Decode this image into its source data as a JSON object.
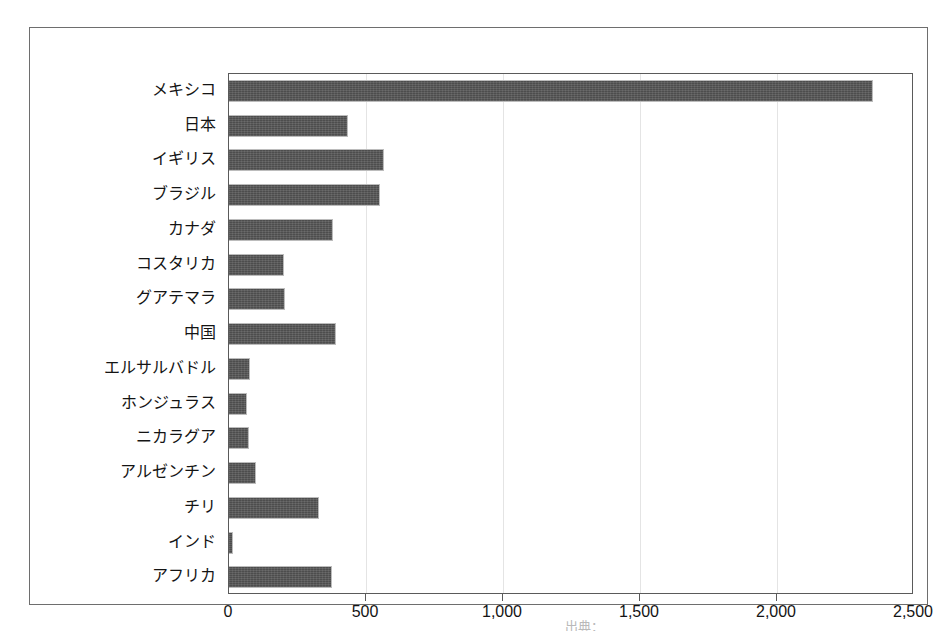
{
  "chart_data": {
    "type": "bar",
    "orientation": "horizontal",
    "title": "",
    "subtitle": "",
    "xlabel": "",
    "ylabel": "",
    "xlim": [
      0,
      2500
    ],
    "xticks": [
      0,
      500,
      1000,
      1500,
      2000,
      2500
    ],
    "xtick_labels": [
      "0",
      "500",
      "1,000",
      "1,500",
      "2,000",
      "2,500"
    ],
    "grid": true,
    "grid_axis": "x",
    "legend": false,
    "legend_position": "none",
    "bar_color": "#4d4d4d",
    "categories": [
      "メキシコ",
      "日本",
      "イギリス",
      "ブラジル",
      "カナダ",
      "コスタリカ",
      "グアテマラ",
      "中国",
      "エルサルバドル",
      "ホンジュラス",
      "ニカラグア",
      "アルゼンチン",
      "チリ",
      "インド",
      "アフリカ"
    ],
    "values": [
      2350,
      435,
      565,
      550,
      380,
      200,
      205,
      390,
      77,
      66,
      73,
      100,
      330,
      15,
      375
    ]
  },
  "source_note": "出典：",
  "colors": {
    "bar": "#4d4d4d",
    "frame": "#6e6e6e",
    "axis": "#5a5a5a",
    "grid": "#e4e4e4",
    "text": "#141414",
    "background": "#ffffff"
  }
}
